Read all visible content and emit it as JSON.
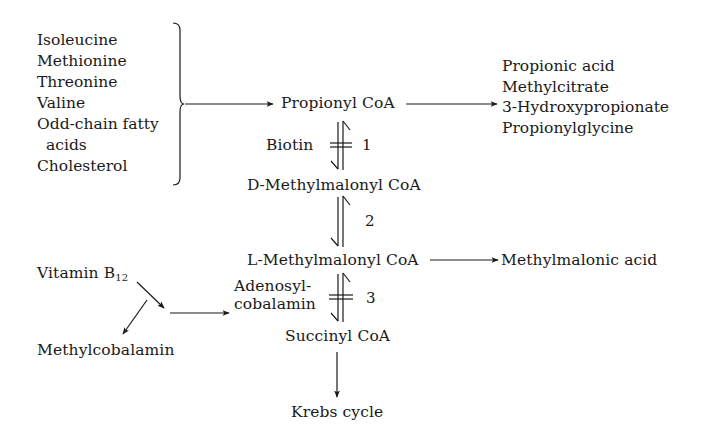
{
  "diagram": {
    "type": "metabolic-pathway",
    "sources": {
      "items": [
        "Isoleucine",
        "Methionine",
        "Threonine",
        "Valine",
        "Odd-chain fatty",
        "acids",
        "Cholesterol"
      ]
    },
    "nodes": {
      "propionyl_coa": "Propionyl CoA",
      "d_methylmalonyl_prefix": "D",
      "d_methylmalonyl_rest": "-Methylmalonyl CoA",
      "l_methylmalonyl_prefix": "L",
      "l_methylmalonyl_rest": "-Methylmalonyl CoA",
      "succinyl_coa": "Succinyl CoA",
      "krebs_cycle": "Krebs cycle",
      "methylmalonic_acid": "Methylmalonic acid",
      "vitamin_b12_base": "Vitamin B",
      "vitamin_b12_sub": "12",
      "methylcobalamin": "Methylcobalamin",
      "adenosylcobalamin_line1": "Adenosyl-",
      "adenosylcobalamin_line2": "cobalamin"
    },
    "products": {
      "items": [
        "Propionic acid",
        "Methylcitrate",
        "3-Hydroxypropionate",
        "Propionylglycine"
      ]
    },
    "cofactors": {
      "step1": "Biotin"
    },
    "steps": {
      "step1": "1",
      "step2": "2",
      "step3": "3"
    }
  }
}
